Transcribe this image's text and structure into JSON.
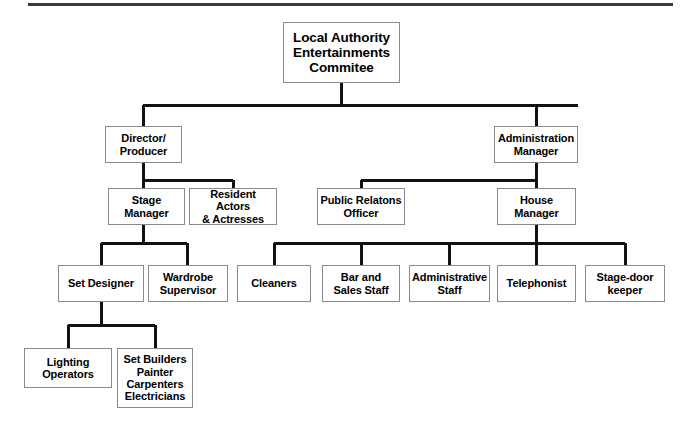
{
  "diagram": {
    "type": "organisational-chart",
    "title_rule": "top-divider",
    "colors": {
      "box_border": "#8a8a8a",
      "connector": "#111111",
      "text": "#000000",
      "background": "#ffffff",
      "rule": "#3a3a3a"
    },
    "nodes": {
      "committee": {
        "label": "Local Authority\nEntertainments\nCommitee",
        "level": 1
      },
      "director_producer": {
        "label": "Director/\nProducer",
        "level": 2
      },
      "administration_manager": {
        "label": "Administration\nManager",
        "level": 2
      },
      "stage_manager": {
        "label": "Stage\nManager",
        "level": 3
      },
      "resident_actors": {
        "label": "Resident Actors\n& Actresses",
        "level": 3
      },
      "public_relations_officer": {
        "label": "Public Relatons\nOfficer",
        "level": 3
      },
      "house_manager": {
        "label": "House\nManager",
        "level": 3
      },
      "set_designer": {
        "label": "Set Designer",
        "level": 4
      },
      "wardrobe_supervisor": {
        "label": "Wardrobe\nSupervisor",
        "level": 4
      },
      "cleaners": {
        "label": "Cleaners",
        "level": 4
      },
      "bar_sales_staff": {
        "label": "Bar and\nSales Staff",
        "level": 4
      },
      "administrative_staff": {
        "label": "Administrative\nStaff",
        "level": 4
      },
      "telephonist": {
        "label": "Telephonist",
        "level": 4
      },
      "stage_door_keeper": {
        "label": "Stage-door\nkeeper",
        "level": 4
      },
      "lighting_operators": {
        "label": "Lighting\nOperators",
        "level": 5
      },
      "set_builders": {
        "label": "Set Builders\nPainter\nCarpenters\nElectricians",
        "level": 5
      }
    },
    "edges": [
      {
        "from": "committee",
        "to": "director_producer"
      },
      {
        "from": "committee",
        "to": "administration_manager"
      },
      {
        "from": "director_producer",
        "to": "stage_manager"
      },
      {
        "from": "director_producer",
        "to": "resident_actors"
      },
      {
        "from": "administration_manager",
        "to": "public_relations_officer"
      },
      {
        "from": "administration_manager",
        "to": "house_manager"
      },
      {
        "from": "stage_manager",
        "to": "set_designer"
      },
      {
        "from": "stage_manager",
        "to": "wardrobe_supervisor"
      },
      {
        "from": "house_manager",
        "to": "cleaners"
      },
      {
        "from": "house_manager",
        "to": "bar_sales_staff"
      },
      {
        "from": "house_manager",
        "to": "administrative_staff"
      },
      {
        "from": "house_manager",
        "to": "telephonist"
      },
      {
        "from": "house_manager",
        "to": "stage_door_keeper"
      },
      {
        "from": "set_designer",
        "to": "lighting_operators"
      },
      {
        "from": "set_designer",
        "to": "set_builders"
      }
    ]
  }
}
